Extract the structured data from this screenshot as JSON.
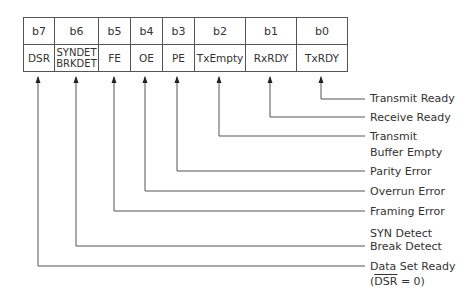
{
  "register": {
    "bits": [
      {
        "bit": "b7",
        "name": "DSR",
        "width": 31
      },
      {
        "bit": "b6",
        "name": "SYNDET\nBRKDET",
        "name_line1": "SYNDET",
        "name_line2": "BRKDET",
        "width": 44
      },
      {
        "bit": "b5",
        "name": "FE",
        "width": 32
      },
      {
        "bit": "b4",
        "name": "OE",
        "width": 32
      },
      {
        "bit": "b3",
        "name": "PE",
        "width": 32
      },
      {
        "bit": "b2",
        "name": "TxEmpty",
        "width": 51
      },
      {
        "bit": "b1",
        "name": "RxRDY",
        "width": 51
      },
      {
        "bit": "b0",
        "name": "TxRDY",
        "width": 51
      }
    ]
  },
  "labels": {
    "b0": "Transmit Ready",
    "b1": "Receive Ready",
    "b2_line1": "Transmit",
    "b2_line2": "Buffer Empty",
    "b3": "Parity Error",
    "b4": "Overrun Error",
    "b5": "Framing Error",
    "b6_line1": "SYN Detect",
    "b6_line2": "Break Detect",
    "b7_line1": "Data Set Ready",
    "b7_line2_prefix": "(",
    "b7_line2_overlined": "DSR",
    "b7_line2_suffix": " = 0)"
  },
  "colors": {
    "line": "#555555",
    "text": "#333333"
  }
}
